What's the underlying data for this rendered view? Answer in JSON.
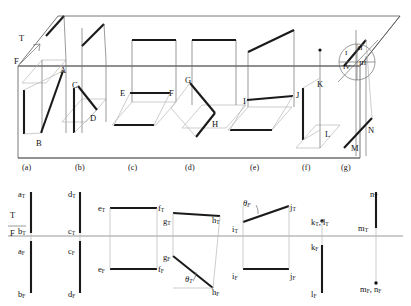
{
  "figure": {
    "colors": {
      "line_dark": "#1a1a1a",
      "line_thin": "#7d7d7d",
      "line_light": "#b4b4b4",
      "reference_line": "#8a8a8a",
      "background": "#ffffff"
    }
  },
  "pictorial": {
    "reference_markers": {
      "top_label": "T",
      "front_label": "F"
    },
    "quadrant_circle": {
      "quadrants": [
        {
          "id": "q1",
          "label": "I"
        },
        {
          "id": "q2",
          "label": "II"
        },
        {
          "id": "q3",
          "label": "III"
        },
        {
          "id": "q4",
          "label": "IV"
        }
      ]
    },
    "point_labels": [
      {
        "id": "A",
        "text": "A",
        "x": 60,
        "y": 66
      },
      {
        "id": "B",
        "text": "B",
        "x": 36,
        "y": 139
      },
      {
        "id": "C",
        "text": "C",
        "x": 72,
        "y": 81
      },
      {
        "id": "D",
        "text": "D",
        "x": 90,
        "y": 114
      },
      {
        "id": "E",
        "text": "E",
        "x": 120,
        "y": 89
      },
      {
        "id": "F",
        "text": "F",
        "x": 169,
        "y": 89
      },
      {
        "id": "G",
        "text": "G",
        "x": 185,
        "y": 76
      },
      {
        "id": "H",
        "text": "H",
        "x": 212,
        "y": 120
      },
      {
        "id": "I",
        "text": "I",
        "x": 243,
        "y": 97
      },
      {
        "id": "J",
        "text": "J",
        "x": 296,
        "y": 91
      },
      {
        "id": "K",
        "text": "K",
        "x": 317,
        "y": 80
      },
      {
        "id": "L",
        "text": "L",
        "x": 325,
        "y": 130
      },
      {
        "id": "M",
        "text": "M",
        "x": 351,
        "y": 144
      },
      {
        "id": "N",
        "text": "N",
        "x": 368,
        "y": 126
      }
    ],
    "panel_captions": [
      {
        "id": "a",
        "text": "(a)",
        "x": 22
      },
      {
        "id": "b",
        "text": "(b)",
        "x": 75
      },
      {
        "id": "c",
        "text": "(c)",
        "x": 128
      },
      {
        "id": "d",
        "text": "(d)",
        "x": 185
      },
      {
        "id": "e",
        "text": "(e)",
        "x": 250
      },
      {
        "id": "f",
        "text": "(f)",
        "x": 302
      },
      {
        "id": "g",
        "text": "(g)",
        "x": 341
      }
    ]
  },
  "orthographic": {
    "reference_line": {
      "top_label": "T",
      "front_label": "F"
    },
    "labels": [
      {
        "id": "aT",
        "base": "a",
        "sub": "T",
        "x": 18,
        "y": 190
      },
      {
        "id": "bT",
        "base": "b",
        "sub": "T",
        "x": 18,
        "y": 227
      },
      {
        "id": "aF",
        "base": "a",
        "sub": "F",
        "x": 18,
        "y": 247
      },
      {
        "id": "bF",
        "base": "b",
        "sub": "F",
        "x": 18,
        "y": 290
      },
      {
        "id": "dT",
        "base": "d",
        "sub": "T",
        "x": 68,
        "y": 190
      },
      {
        "id": "cT",
        "base": "c",
        "sub": "T",
        "x": 68,
        "y": 227
      },
      {
        "id": "cF",
        "base": "c",
        "sub": "F",
        "x": 68,
        "y": 247
      },
      {
        "id": "dF",
        "base": "d",
        "sub": "F",
        "x": 68,
        "y": 290
      },
      {
        "id": "eT",
        "base": "e",
        "sub": "T",
        "x": 98,
        "y": 204
      },
      {
        "id": "fT",
        "base": "f",
        "sub": "T",
        "x": 158,
        "y": 204
      },
      {
        "id": "eF",
        "base": "e",
        "sub": "F",
        "x": 98,
        "y": 265
      },
      {
        "id": "fF",
        "base": "f",
        "sub": "F",
        "x": 158,
        "y": 265
      },
      {
        "id": "gT",
        "base": "g",
        "sub": "T",
        "x": 163,
        "y": 217
      },
      {
        "id": "gF",
        "base": "g",
        "sub": "F",
        "x": 163,
        "y": 253
      },
      {
        "id": "hT",
        "base": "h",
        "sub": "T",
        "x": 212,
        "y": 216
      },
      {
        "id": "hF",
        "base": "h",
        "sub": "F",
        "x": 212,
        "y": 288
      },
      {
        "id": "iT",
        "base": "i",
        "sub": "T",
        "x": 232,
        "y": 225
      },
      {
        "id": "jT",
        "base": "j",
        "sub": "T",
        "x": 290,
        "y": 203
      },
      {
        "id": "iF",
        "base": "i",
        "sub": "F",
        "x": 232,
        "y": 272
      },
      {
        "id": "jF",
        "base": "j",
        "sub": "F",
        "x": 290,
        "y": 272
      },
      {
        "id": "kTlT",
        "base": "k",
        "sub": "T",
        "base2": "l",
        "sub2": "T",
        "x": 311,
        "y": 218
      },
      {
        "id": "kF",
        "base": "k",
        "sub": "F",
        "x": 311,
        "y": 243
      },
      {
        "id": "lF",
        "base": "l",
        "sub": "F",
        "x": 311,
        "y": 290
      },
      {
        "id": "nT",
        "base": "n",
        "sub": "T",
        "x": 370,
        "y": 190
      },
      {
        "id": "mT",
        "base": "m",
        "sub": "T",
        "x": 358,
        "y": 224
      },
      {
        "id": "mFnF",
        "base": "m",
        "sub": "F",
        "base2": "n",
        "sub2": "F",
        "x": 360,
        "y": 285
      }
    ],
    "angles": [
      {
        "id": "thetaT-g",
        "symbol": "θ",
        "sub": "T",
        "x": 185,
        "y": 275
      },
      {
        "id": "thetaF-i",
        "symbol": "θ",
        "sub": "F",
        "x": 243,
        "y": 199
      }
    ]
  }
}
